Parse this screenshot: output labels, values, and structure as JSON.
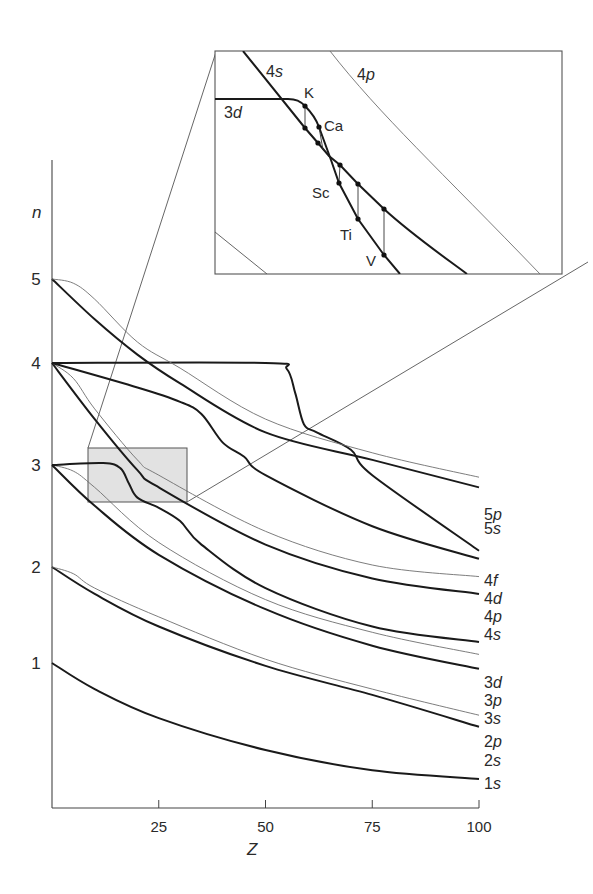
{
  "chart_data": {
    "type": "line",
    "title": "",
    "xlabel": "Z",
    "ylabel": "n",
    "xlim": [
      0,
      100
    ],
    "ylim": [
      0,
      6
    ],
    "x_ticks": [
      "25",
      "50",
      "75",
      "100"
    ],
    "y_ticks": [
      "1",
      "2",
      "3",
      "4",
      "5"
    ],
    "grid": false,
    "legend_position": "right-end labels",
    "colors": {
      "thick": "#1a1a1a",
      "thin": "#6e6e6e",
      "shade": "#e2e2e2"
    },
    "series": [
      {
        "name": "1s",
        "style": "thick",
        "points": [
          [
            0,
            1.0
          ],
          [
            10,
            0.82
          ],
          [
            25,
            0.62
          ],
          [
            50,
            0.4
          ],
          [
            75,
            0.26
          ],
          [
            100,
            0.2
          ]
        ]
      },
      {
        "name": "2s",
        "style": "thick",
        "points": [
          [
            0,
            2.0
          ],
          [
            10,
            1.72
          ],
          [
            25,
            1.38
          ],
          [
            50,
            0.98
          ],
          [
            75,
            0.78
          ],
          [
            100,
            0.56
          ]
        ]
      },
      {
        "name": "2p",
        "style": "thin",
        "points": [
          [
            0,
            2.0
          ],
          [
            5,
            1.93
          ],
          [
            10,
            1.78
          ],
          [
            25,
            1.48
          ],
          [
            50,
            1.04
          ],
          [
            75,
            0.82
          ],
          [
            100,
            0.64
          ]
        ]
      },
      {
        "name": "3s",
        "style": "thick",
        "points": [
          [
            0,
            3.0
          ],
          [
            10,
            2.6
          ],
          [
            25,
            2.12
          ],
          [
            50,
            1.56
          ],
          [
            75,
            1.18
          ],
          [
            100,
            0.96
          ]
        ]
      },
      {
        "name": "3p",
        "style": "thin",
        "points": [
          [
            0,
            3.0
          ],
          [
            5,
            2.94
          ],
          [
            10,
            2.78
          ],
          [
            25,
            2.24
          ],
          [
            50,
            1.66
          ],
          [
            75,
            1.32
          ],
          [
            100,
            1.09
          ]
        ]
      },
      {
        "name": "3d",
        "style": "thick",
        "points": [
          [
            0,
            3.0
          ],
          [
            12,
            3.02
          ],
          [
            16,
            2.97
          ],
          [
            18,
            2.82
          ],
          [
            20,
            2.68
          ],
          [
            25,
            2.58
          ],
          [
            30,
            2.45
          ],
          [
            35,
            2.22
          ],
          [
            50,
            1.78
          ],
          [
            75,
            1.38
          ],
          [
            100,
            1.22
          ]
        ]
      },
      {
        "name": "4s",
        "style": "thick",
        "points": [
          [
            0,
            4.0
          ],
          [
            10,
            3.45
          ],
          [
            20,
            2.95
          ],
          [
            25,
            2.78
          ],
          [
            50,
            2.22
          ],
          [
            75,
            1.88
          ],
          [
            100,
            1.72
          ]
        ]
      },
      {
        "name": "4p",
        "style": "thin",
        "points": [
          [
            0,
            4.0
          ],
          [
            5,
            3.85
          ],
          [
            10,
            3.55
          ],
          [
            20,
            3.05
          ],
          [
            25,
            2.9
          ],
          [
            50,
            2.35
          ],
          [
            75,
            2.02
          ],
          [
            100,
            1.9
          ]
        ]
      },
      {
        "name": "4d",
        "style": "thick",
        "points": [
          [
            0,
            4.0
          ],
          [
            20,
            3.76
          ],
          [
            30,
            3.62
          ],
          [
            35,
            3.5
          ],
          [
            40,
            3.22
          ],
          [
            45,
            3.08
          ],
          [
            50,
            2.9
          ],
          [
            75,
            2.4
          ],
          [
            100,
            2.08
          ]
        ]
      },
      {
        "name": "4f",
        "style": "thick",
        "points": [
          [
            0,
            4.0
          ],
          [
            50,
            4.0
          ],
          [
            55,
            3.94
          ],
          [
            57,
            3.7
          ],
          [
            59,
            3.4
          ],
          [
            62,
            3.32
          ],
          [
            70,
            3.15
          ],
          [
            75,
            2.9
          ],
          [
            100,
            2.16
          ]
        ]
      },
      {
        "name": "5s",
        "style": "thick",
        "points": [
          [
            0,
            5.0
          ],
          [
            10,
            4.52
          ],
          [
            20,
            4.1
          ],
          [
            30,
            3.8
          ],
          [
            50,
            3.32
          ],
          [
            75,
            3.05
          ],
          [
            100,
            2.78
          ]
        ]
      },
      {
        "name": "5p",
        "style": "thin",
        "points": [
          [
            0,
            5.0
          ],
          [
            5,
            4.95
          ],
          [
            10,
            4.76
          ],
          [
            20,
            4.25
          ],
          [
            30,
            3.95
          ],
          [
            50,
            3.45
          ],
          [
            75,
            3.12
          ],
          [
            100,
            2.88
          ]
        ]
      }
    ],
    "annotations": {
      "highlight_region": {
        "z_range": [
          8,
          32
        ],
        "n_range": [
          2.62,
          3.18
        ]
      },
      "inset": {
        "description": "Magnified view of 3d/4s crossing",
        "curve_labels": [
          "4s",
          "4p",
          "3d"
        ],
        "elements": [
          "K",
          "Ca",
          "Sc",
          "Ti",
          "V"
        ]
      }
    }
  },
  "axes": {
    "y_label": "n",
    "x_label": "Z",
    "y_ticks": [
      {
        "label": "5",
        "n": 5
      },
      {
        "label": "4",
        "n": 4
      },
      {
        "label": "3",
        "n": 3
      },
      {
        "label": "2",
        "n": 2
      },
      {
        "label": "1",
        "n": 1
      }
    ],
    "x_ticks": [
      {
        "label": "25",
        "z": 25
      },
      {
        "label": "50",
        "z": 50
      },
      {
        "label": "75",
        "z": 75
      },
      {
        "label": "100",
        "z": 100
      }
    ]
  },
  "end_labels": [
    {
      "num": "5",
      "sub": "p",
      "y": 520
    },
    {
      "num": "5",
      "sub": "s",
      "y": 534
    },
    {
      "num": "4",
      "sub": "f",
      "y": 586
    },
    {
      "num": "4",
      "sub": "d",
      "y": 604
    },
    {
      "num": "4",
      "sub": "p",
      "y": 622
    },
    {
      "num": "4",
      "sub": "s",
      "y": 640
    },
    {
      "num": "3",
      "sub": "d",
      "y": 688
    },
    {
      "num": "3",
      "sub": "p",
      "y": 706
    },
    {
      "num": "3",
      "sub": "s",
      "y": 724
    },
    {
      "num": "2",
      "sub": "p",
      "y": 747
    },
    {
      "num": "2",
      "sub": "s",
      "y": 766
    },
    {
      "num": "1",
      "sub": "s",
      "y": 789
    }
  ],
  "inset": {
    "labels": {
      "s4_num": "4",
      "s4_sub": "s",
      "p4_num": "4",
      "p4_sub": "p",
      "d3_num": "3",
      "d3_sub": "d"
    },
    "elements": [
      {
        "name": "K",
        "x": 304,
        "y": 98
      },
      {
        "name": "Ca",
        "x": 324,
        "y": 131
      },
      {
        "name": "Sc",
        "x": 312,
        "y": 198
      },
      {
        "name": "Ti",
        "x": 340,
        "y": 240
      },
      {
        "name": "V",
        "x": 366,
        "y": 266
      }
    ]
  }
}
